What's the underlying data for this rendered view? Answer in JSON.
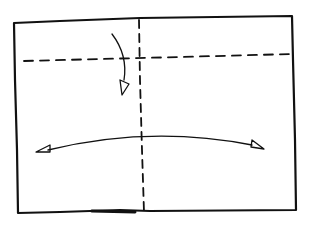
{
  "diagram": {
    "type": "folding-instruction",
    "style": "hand-drawn",
    "background": "#ffffff",
    "stroke_color": "#111111",
    "paper": {
      "corners": [
        [
          14,
          23
        ],
        [
          292,
          16
        ],
        [
          296,
          210
        ],
        [
          18,
          213
        ]
      ]
    },
    "fold_lines": [
      {
        "name": "vertical-crease",
        "style": "dashed",
        "from": [
          141,
          20
        ],
        "to": [
          145,
          212
        ]
      },
      {
        "name": "horizontal-crease",
        "style": "dashed",
        "from": [
          24,
          61
        ],
        "to": [
          292,
          54
        ]
      }
    ],
    "arrows": [
      {
        "name": "fold-down-arrow",
        "direction": "down",
        "from": [
          112,
          34
        ],
        "to": [
          124,
          94
        ]
      },
      {
        "name": "fold-sideways-arrow",
        "direction": "both",
        "from": [
          36,
          151
        ],
        "to": [
          264,
          148
        ]
      }
    ]
  }
}
